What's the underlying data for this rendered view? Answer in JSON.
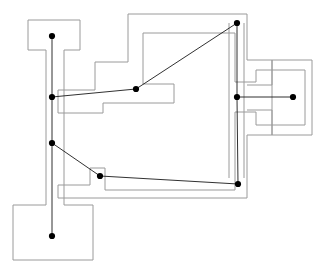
{
  "figure": {
    "kind": "topological-floor-plan",
    "width": 322,
    "height": 272,
    "background_color": "#ffffff",
    "wall_color": "#9a9a9a",
    "edge_color": "#1a1a1a",
    "node_color": "#000000",
    "node_radius": 3.1,
    "wall_stroke_width": 1,
    "edge_stroke_width": 0.9
  },
  "chart_data": {
    "type": "scatter",
    "title": "",
    "xlabel": "",
    "ylabel": "",
    "xlim": [
      0,
      322
    ],
    "ylim": [
      272,
      0
    ],
    "grid": false,
    "legend": "none",
    "nodes": [
      {
        "id": "n0",
        "name": "top-left-room-node",
        "x": 52,
        "y": 36
      },
      {
        "id": "n1",
        "name": "left-upper-corridor-node",
        "x": 52,
        "y": 97
      },
      {
        "id": "n2",
        "name": "left-lower-corridor-node",
        "x": 52,
        "y": 143
      },
      {
        "id": "n3",
        "name": "bottom-left-room-node",
        "x": 52,
        "y": 236
      },
      {
        "id": "n4",
        "name": "center-hall-node",
        "x": 136,
        "y": 89
      },
      {
        "id": "n5",
        "name": "top-right-corner-node",
        "x": 237,
        "y": 23
      },
      {
        "id": "n6",
        "name": "right-corridor-node",
        "x": 237,
        "y": 97
      },
      {
        "id": "n7",
        "name": "right-room-node",
        "x": 293,
        "y": 97
      },
      {
        "id": "n8",
        "name": "lower-center-node",
        "x": 100,
        "y": 176
      },
      {
        "id": "n9",
        "name": "lower-right-corner-node",
        "x": 238,
        "y": 184
      }
    ],
    "edges": [
      {
        "from": "n0",
        "to": "n1"
      },
      {
        "from": "n1",
        "to": "n2"
      },
      {
        "from": "n2",
        "to": "n3"
      },
      {
        "from": "n1",
        "to": "n4"
      },
      {
        "from": "n4",
        "to": "n5"
      },
      {
        "from": "n5",
        "to": "n6"
      },
      {
        "from": "n6",
        "to": "n7"
      },
      {
        "from": "n6",
        "to": "n9"
      },
      {
        "from": "n2",
        "to": "n8"
      },
      {
        "from": "n8",
        "to": "n9"
      }
    ],
    "walls": [
      {
        "name": "top-left-room-outline",
        "d": "M 46 50 L 28 50 L 28 20 L 80 20 L 80 50 L 64 50"
      },
      {
        "name": "left-corridor-walls",
        "d": "M 46 50 L 46 205 M 64 50 L 64 205"
      },
      {
        "name": "bottom-left-room-outline",
        "d": "M 46 205 L 13 205 L 13 260 L 93 260 L 93 205 L 64 205"
      },
      {
        "name": "central-hall-outer-outline",
        "d": "M 58 113 L 58 90 L 95 90 L 95 62 L 128 62 L 128 14 L 247 14 L 247 60 L 272 60 L 272 135 L 247 135 L 247 198 L 58 198 L 58 185 L 90 185 L 90 172"
      },
      {
        "name": "central-hall-inner-outline",
        "d": "M 58 113 L 103 113 L 103 103 L 174 103 L 174 84 L 143 84 L 143 33 L 235 33 L 235 82 L 256 82 L 256 70 L 305 70 L 305 125 L 256 125 L 256 112 L 235 112 L 235 190 L 105 190 L 105 168 L 90 168 L 90 172"
      },
      {
        "name": "right-room-outer-notch",
        "d": "M 272 60 L 272 85 L 247 85 M 272 135 L 272 110 L 247 110"
      },
      {
        "name": "right-wing-outline",
        "d": "M 272 60 L 312 60 L 312 135 L 272 135"
      },
      {
        "name": "central-column-walls",
        "d": "M 229 23 L 229 178 M 244 23 L 244 178"
      }
    ]
  }
}
